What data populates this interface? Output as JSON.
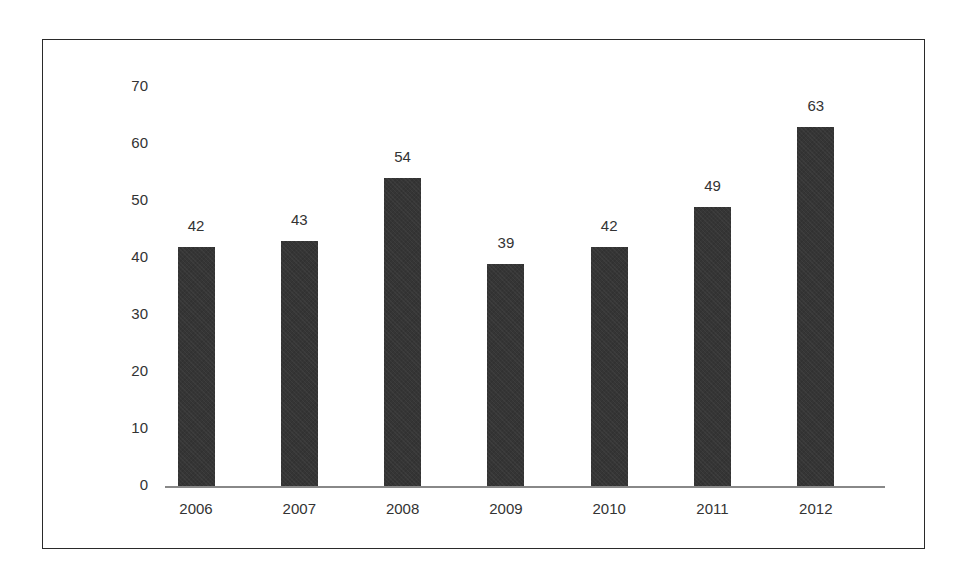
{
  "chart_data": {
    "type": "bar",
    "title": "",
    "xlabel": "",
    "ylabel": "",
    "categories": [
      "2006",
      "2007",
      "2008",
      "2009",
      "2010",
      "2011",
      "2012"
    ],
    "values": [
      42,
      43,
      54,
      39,
      42,
      49,
      63
    ],
    "data_labels": [
      "42",
      "43",
      "54",
      "39",
      "42",
      "49",
      "63"
    ],
    "ylim": [
      0,
      70
    ],
    "yticks": [
      "0",
      "10",
      "20",
      "30",
      "40",
      "50",
      "60",
      "70"
    ],
    "grid": false,
    "legend": null,
    "bar_color": "#353535"
  }
}
